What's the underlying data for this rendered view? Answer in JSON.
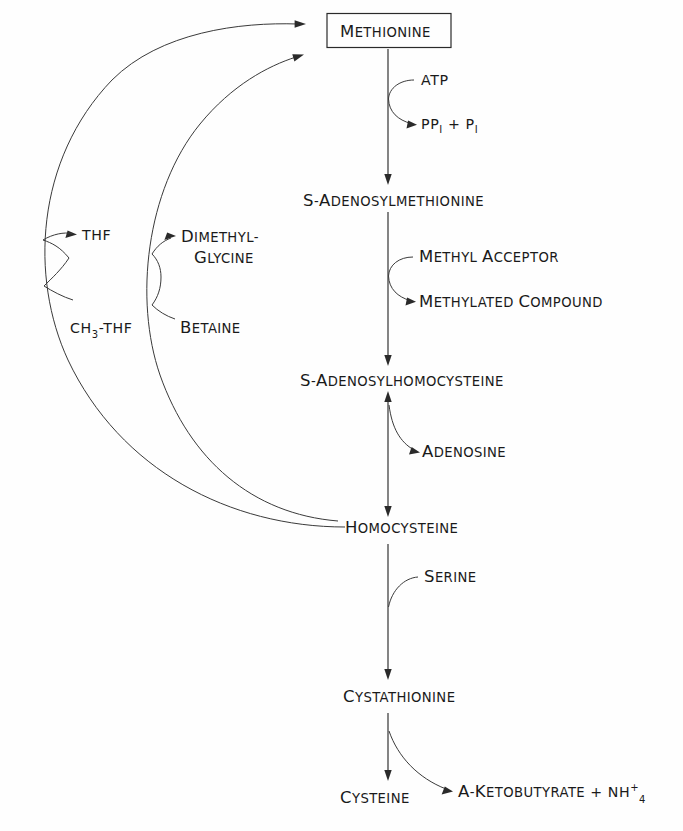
{
  "figure": {
    "background_color": "#fefefe",
    "line_color": "#2a2a2a",
    "text_color": "#1a1a1a"
  },
  "nodes": {
    "methionine": {
      "label": "Methionine",
      "boxed": true
    },
    "sam": {
      "label": "S-Adenosylmethionine",
      "boxed": false
    },
    "sah": {
      "label": "S-Adenosylhomocysteine",
      "boxed": false
    },
    "homocysteine": {
      "label": "Homocysteine",
      "boxed": false
    },
    "cystathionine": {
      "label": "Cystathionine",
      "boxed": false
    },
    "cysteine": {
      "label": "Cysteine",
      "boxed": false
    }
  },
  "cofactors": {
    "atp": "ATP",
    "ppi_main": "PP",
    "ppi_sub": "I",
    "ppi_plus": "+",
    "pi_main": "P",
    "pi_sub": "I",
    "methyl_acceptor": "Methyl Acceptor",
    "methylated_compound": "Methylated Compound",
    "adenosine": "Adenosine",
    "serine": "Serine",
    "thf": "THF",
    "ch3_thf_pre": "CH",
    "ch3_thf_sub": "3",
    "ch3_thf_post": "-THF",
    "dimethyl_line1": "Dimethyl-",
    "dimethyl_line2": "glycine",
    "betaine": "Betaine",
    "ketobutyrate": "α-Ketobutyrate",
    "ketobutyrate_plus": "+",
    "ammonium_main": "NH",
    "ammonium_sup": "+",
    "ammonium_sub": "4"
  },
  "reactions": [
    {
      "from": "methionine",
      "to": "sam",
      "consumes": "ATP",
      "produces": "PP_I + P_I"
    },
    {
      "from": "sam",
      "to": "sah",
      "consumes": "Methyl Acceptor",
      "produces": "Methylated Compound"
    },
    {
      "from": "sah",
      "to": "homocysteine",
      "produces": "Adenosine",
      "reversible": true
    },
    {
      "from": "homocysteine",
      "to": "cystathionine",
      "consumes": "Serine"
    },
    {
      "from": "cystathionine",
      "to": "cysteine",
      "produces": "α-Ketobutyrate + NH4+"
    },
    {
      "from": "homocysteine",
      "to": "methionine",
      "consumes": "CH3-THF",
      "produces": "THF"
    },
    {
      "from": "homocysteine",
      "to": "methionine",
      "consumes": "Betaine",
      "produces": "Dimethylglycine"
    }
  ]
}
